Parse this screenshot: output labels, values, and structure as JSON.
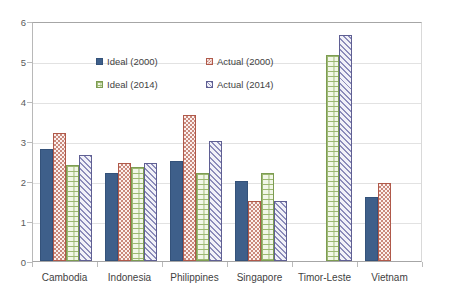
{
  "chart_data": {
    "type": "bar",
    "title": "",
    "subtitle": "",
    "xlabel": "",
    "ylabel": "",
    "ylim": [
      0,
      6
    ],
    "y_ticks": [
      0,
      1,
      2,
      3,
      4,
      5,
      6
    ],
    "y_tick_labels": [
      "0",
      "1",
      "2",
      "3",
      "4",
      "5",
      "6"
    ],
    "grid": true,
    "legend_position": "inside-top-center",
    "categories": [
      "Cambodia",
      "Indonesia",
      "Philippines",
      "Singapore",
      "Timor-Leste",
      "Vietnam"
    ],
    "series": [
      {
        "name": "Ideal (2000)",
        "key": "ideal2000",
        "color": "#3e5f8a",
        "pattern": "solid",
        "values": [
          2.8,
          2.2,
          2.5,
          2.0,
          null,
          1.6
        ]
      },
      {
        "name": "Actual (2000)",
        "key": "actual2000",
        "color": "#b0594a",
        "pattern": "checker",
        "values": [
          3.2,
          2.45,
          3.65,
          1.5,
          null,
          1.95
        ]
      },
      {
        "name": "Ideal (2014)",
        "key": "ideal2014",
        "color": "#7d9c52",
        "pattern": "brick",
        "values": [
          2.4,
          2.35,
          2.2,
          2.2,
          5.15,
          null
        ]
      },
      {
        "name": "Actual (2014)",
        "key": "actual2014",
        "color": "#5f5f93",
        "pattern": "diagonal",
        "values": [
          2.65,
          2.45,
          3.0,
          1.5,
          5.65,
          null
        ]
      }
    ]
  },
  "legend": {
    "items": [
      {
        "label": "Ideal (2000)",
        "key": "ideal2000"
      },
      {
        "label": "Actual (2000)",
        "key": "actual2000"
      },
      {
        "label": "Ideal (2014)",
        "key": "ideal2014"
      },
      {
        "label": "Actual (2014)",
        "key": "actual2014"
      }
    ]
  },
  "colors": {
    "ideal2000": "#3e5f8a",
    "actual2000": "#b0594a",
    "ideal2014": "#7d9c52",
    "actual2014": "#5f5f93",
    "grid": "#e2e2e2",
    "axis": "#a6a6a6",
    "text": "#3f3f3f",
    "background": "#ffffff"
  }
}
